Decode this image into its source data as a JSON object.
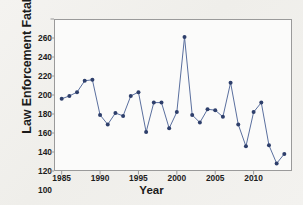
{
  "chart_data": {
    "type": "line",
    "title": "",
    "xlabel": "Year",
    "ylabel": "Law Enforcement Fatalities",
    "x": [
      1985,
      1986,
      1987,
      1988,
      1989,
      1990,
      1991,
      1992,
      1993,
      1994,
      1995,
      1996,
      1997,
      1998,
      1999,
      2000,
      2001,
      2002,
      2003,
      2004,
      2005,
      2006,
      2007,
      2008,
      2009,
      2010,
      2011,
      2012,
      2013,
      2014
    ],
    "values": [
      176,
      179,
      183,
      195,
      196,
      159,
      149,
      161,
      158,
      179,
      183,
      141,
      172,
      172,
      145,
      162,
      241,
      159,
      151,
      165,
      164,
      157,
      193,
      149,
      126,
      162,
      172,
      127,
      108,
      118
    ],
    "series": [
      {
        "name": "Law Enforcement Fatalities",
        "values": [
          176,
          179,
          183,
          195,
          196,
          159,
          149,
          161,
          158,
          179,
          183,
          141,
          172,
          172,
          145,
          162,
          241,
          159,
          151,
          165,
          164,
          157,
          193,
          149,
          126,
          162,
          172,
          127,
          108,
          118
        ]
      }
    ],
    "xlim": [
      1984,
      2015
    ],
    "ylim": [
      100,
      260
    ],
    "xticks": [
      1985,
      1990,
      1995,
      2000,
      2005,
      2010
    ],
    "yticks": [
      100,
      120,
      140,
      160,
      180,
      200,
      220,
      240,
      260
    ],
    "xtick_labels": [
      "1985",
      "1990",
      "1995",
      "2000",
      "2005",
      "2010"
    ],
    "ytick_labels": [
      "100",
      "120",
      "140",
      "160",
      "180",
      "200",
      "220",
      "240",
      "260"
    ],
    "grid": false,
    "legend": null,
    "legend_position": "none",
    "marker": "circle",
    "line_color": "#5a6f9e",
    "marker_color": "#2e3f6b",
    "axis_color": "#9a9a9a",
    "plot_background": "#fbfbfa",
    "figure_background": "#f2f1ee"
  }
}
